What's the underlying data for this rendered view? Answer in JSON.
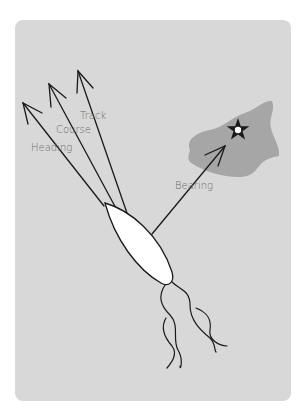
{
  "diagram": {
    "labels": {
      "heading": "Heading",
      "course": "Course",
      "track": "Track",
      "bearing": "Bearing"
    },
    "colors": {
      "background": "#d8d8d8",
      "island": "#a6a6a6",
      "boat": "#ffffff",
      "lines": "#1a1a1a",
      "label_text": "#6b6b6b"
    },
    "elements": [
      "boat",
      "heading-arrow",
      "course-arrow",
      "track-arrow",
      "bearing-arrow",
      "island",
      "waypoint-star",
      "wake"
    ]
  }
}
